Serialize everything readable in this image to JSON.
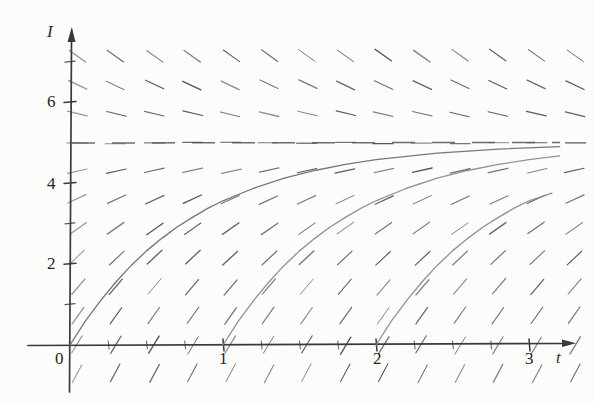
{
  "figure": {
    "title": "",
    "background_color": "#fcfcfa",
    "ink_color": "#3a3a3a"
  },
  "axes": {
    "y_axis_label": "I",
    "x_axis_label": "t",
    "origin_label": "0",
    "y_tick_labels": [
      "2",
      "4",
      "6"
    ],
    "x_tick_labels": [
      "1",
      "2",
      "3"
    ]
  },
  "chart_data": {
    "type": "line",
    "title": "",
    "xlabel": "t",
    "ylabel": "I",
    "xlim": [
      -0.12,
      3.42
    ],
    "ylim": [
      -0.9,
      7.6
    ],
    "grid": false,
    "legend": "none",
    "x_ticks": [
      0,
      1,
      2,
      3
    ],
    "x_tick_labels": [
      "0",
      "1",
      "2",
      "3"
    ],
    "x_minor_ticks": [
      0.25,
      0.5,
      0.75,
      1.25,
      1.5,
      1.75,
      2.25,
      2.5,
      2.75,
      3.25
    ],
    "y_ticks": [
      2,
      4,
      6
    ],
    "y_tick_labels": [
      "2",
      "4",
      "6"
    ],
    "y_minor_ticks": [
      1,
      3,
      5,
      7
    ],
    "equation": "dI/dt = k (5 - I)",
    "equilibrium": {
      "value": 5,
      "label": "I = 5",
      "style": "dashed",
      "color": "#555555"
    },
    "slope_field": {
      "description": "direction field of dI/dt = k(5 - I); slope depends only on I",
      "k": 1.25,
      "x_grid": [
        0.05,
        0.3,
        0.55,
        0.8,
        1.05,
        1.3,
        1.55,
        1.8,
        2.05,
        2.3,
        2.55,
        2.8,
        3.05,
        3.3
      ],
      "y_grid": [
        -0.7,
        0.0,
        0.72,
        1.44,
        2.16,
        2.88,
        3.6,
        4.32,
        5.0,
        5.72,
        6.44,
        7.16
      ],
      "tick_length_px": 20,
      "color": "#4a4a4a"
    },
    "series": [
      {
        "name": "solution through (0, 0)",
        "color": "#6b6b6b",
        "start_point": [
          0,
          0
        ],
        "formula": "I(t) = 5 (1 - e^(-1.25 t))",
        "points": [
          [
            0.0,
            0.0
          ],
          [
            0.1,
            0.59
          ],
          [
            0.2,
            1.1
          ],
          [
            0.3,
            1.56
          ],
          [
            0.4,
            1.97
          ],
          [
            0.5,
            2.33
          ],
          [
            0.6,
            2.64
          ],
          [
            0.7,
            2.92
          ],
          [
            0.8,
            3.16
          ],
          [
            0.9,
            3.38
          ],
          [
            1.0,
            3.57
          ],
          [
            1.2,
            3.88
          ],
          [
            1.4,
            4.13
          ],
          [
            1.6,
            4.32
          ],
          [
            1.8,
            4.47
          ],
          [
            2.0,
            4.59
          ],
          [
            2.4,
            4.75
          ],
          [
            2.8,
            4.85
          ],
          [
            3.2,
            4.91
          ],
          [
            3.4,
            4.93
          ]
        ]
      },
      {
        "name": "solution through (1, 0)",
        "color": "#8a8a8a",
        "start_point": [
          1,
          0
        ],
        "formula": "I(t) = 5 (1 - e^(-1.25 (t-1)))",
        "points": [
          [
            1.0,
            0.0
          ],
          [
            1.1,
            0.59
          ],
          [
            1.2,
            1.1
          ],
          [
            1.3,
            1.56
          ],
          [
            1.4,
            1.97
          ],
          [
            1.5,
            2.33
          ],
          [
            1.6,
            2.64
          ],
          [
            1.7,
            2.92
          ],
          [
            1.8,
            3.16
          ],
          [
            1.9,
            3.38
          ],
          [
            2.0,
            3.57
          ],
          [
            2.2,
            3.88
          ],
          [
            2.4,
            4.13
          ],
          [
            2.6,
            4.32
          ],
          [
            2.8,
            4.47
          ],
          [
            3.0,
            4.59
          ],
          [
            3.2,
            4.68
          ],
          [
            3.4,
            4.75
          ]
        ]
      },
      {
        "name": "solution through (2, 0)",
        "color": "#8a8a8a",
        "start_point": [
          2,
          0
        ],
        "formula": "I(t) = 5 (1 - e^(-1.25 (t-2)))",
        "points": [
          [
            2.0,
            0.0
          ],
          [
            2.1,
            0.59
          ],
          [
            2.2,
            1.1
          ],
          [
            2.3,
            1.56
          ],
          [
            2.4,
            1.97
          ],
          [
            2.5,
            2.33
          ],
          [
            2.6,
            2.64
          ],
          [
            2.7,
            2.92
          ],
          [
            2.8,
            3.16
          ],
          [
            2.9,
            3.38
          ],
          [
            3.0,
            3.57
          ],
          [
            3.15,
            3.76
          ],
          [
            3.3,
            3.92
          ],
          [
            3.4,
            4.01
          ]
        ]
      }
    ]
  }
}
